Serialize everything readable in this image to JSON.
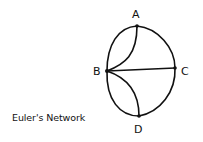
{
  "caption": "Euler's Network",
  "graph": {
    "nodes": [
      {
        "id": "A",
        "label": "A"
      },
      {
        "id": "B",
        "label": "B"
      },
      {
        "id": "C",
        "label": "C"
      },
      {
        "id": "D",
        "label": "D"
      }
    ],
    "edges": [
      {
        "from": "A",
        "to": "B",
        "shape": "outer arc"
      },
      {
        "from": "A",
        "to": "B",
        "shape": "inner curve"
      },
      {
        "from": "A",
        "to": "C",
        "shape": "arc"
      },
      {
        "from": "B",
        "to": "C",
        "shape": "straight"
      },
      {
        "from": "B",
        "to": "D",
        "shape": "outer arc"
      },
      {
        "from": "B",
        "to": "D",
        "shape": "inner curve"
      },
      {
        "from": "C",
        "to": "D",
        "shape": "arc"
      }
    ]
  },
  "colors": {
    "line": "#111111",
    "background": "#ffffff"
  }
}
